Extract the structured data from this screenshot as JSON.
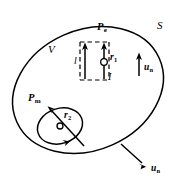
{
  "figure": {
    "stroke_color": "#000000",
    "background_color": "#ffffff"
  },
  "labels": {
    "surface": "S",
    "volume": "V",
    "electric_dipole": "P",
    "electric_dipole_sub": "e",
    "magnetic_dipole": "P",
    "magnetic_dipole_sub": "m",
    "length": "l",
    "current": "I",
    "position_electric": "r",
    "position_electric_sub": "1",
    "position_magnetic": "r",
    "position_magnetic_sub": "2",
    "normal_inner": "u",
    "normal_inner_sub": "n",
    "normal_outer": "u",
    "normal_outer_sub": "n"
  },
  "icons": {
    "surface_boundary": "ellipse-outline-icon",
    "electric_dipole_frame": "dashed-rectangle-icon",
    "current_arrow_left": "up-arrow-icon",
    "current_arrow_right": "up-arrow-icon",
    "field_point_electric": "open-circle-point-icon",
    "field_point_magnetic": "open-circle-point-icon",
    "magnetic_loop": "current-loop-icon",
    "magnetic_loop_direction": "loop-direction-arrow-icon",
    "magnetic_moment_arrow": "diagonal-arrow-icon",
    "normal_vector_inner": "up-arrow-icon",
    "normal_vector_outer": "down-right-arrow-icon"
  }
}
